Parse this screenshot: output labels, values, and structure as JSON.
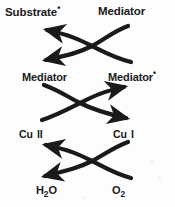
{
  "figure": {
    "background_color": "#fdfdfd",
    "ink_color": "#1a1a1a",
    "width": 175,
    "height": 207
  },
  "rows": [
    {
      "id": "row-substrate",
      "left": {
        "text": "Substrate",
        "superscript": "•"
      },
      "right": {
        "text": "[Substrate]",
        "superscript": ""
      }
    },
    {
      "id": "row-mediator",
      "left": {
        "text": "Mediator",
        "superscript": ""
      },
      "right": {
        "text": "Mediator",
        "superscript": "•"
      }
    },
    {
      "id": "row-copper",
      "left": {
        "text": "Cu",
        "spacer": " ",
        "numeral": "II"
      },
      "right": {
        "text": "Cu",
        "spacer": " ",
        "numeral": "I"
      }
    },
    {
      "id": "row-oxygen",
      "left": {
        "text": "H",
        "subscript": "2",
        "tail": "O"
      },
      "right": {
        "text": "O",
        "subscript": "2",
        "tail": ""
      }
    }
  ],
  "arrow_blocks": [
    {
      "id": "arrow-block-substrate",
      "direction": "leftward",
      "description": "crossed arrows, both arrowheads point left toward Substrate radical"
    },
    {
      "id": "arrow-block-mediator",
      "direction": "rightward",
      "description": "crossed arrows, both arrowheads point right toward Mediator radical and Cu I"
    },
    {
      "id": "arrow-block-copper",
      "direction": "leftward",
      "description": "crossed arrows, both arrowheads point left toward Cu II and H2O"
    }
  ]
}
